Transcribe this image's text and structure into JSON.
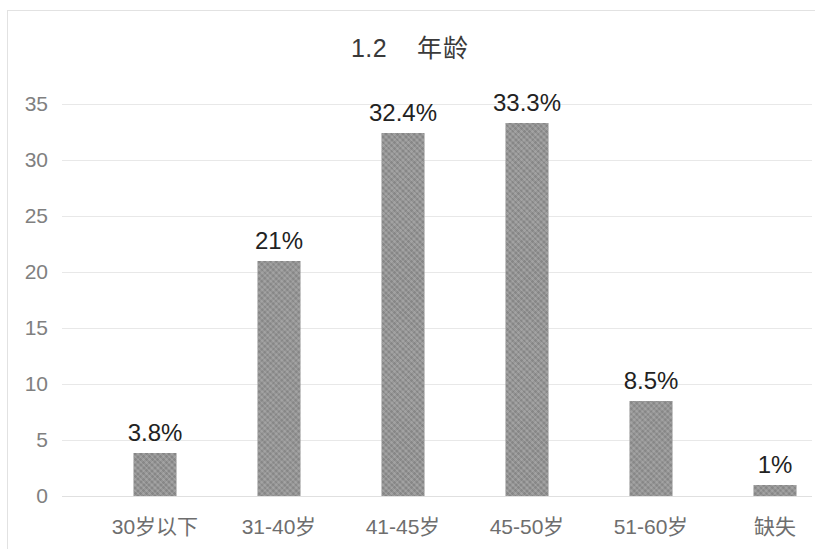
{
  "chart_data": {
    "type": "bar",
    "title": "1.2    年龄",
    "title_number": "1.2",
    "title_text": "年龄",
    "xlabel": "",
    "ylabel": "",
    "categories": [
      "30岁以下",
      "31-40岁",
      "41-45岁",
      "45-50岁",
      "51-60岁",
      "缺失"
    ],
    "values": [
      3.8,
      21,
      32.4,
      33.3,
      8.5,
      1
    ],
    "data_labels": [
      "3.8%",
      "21%",
      "32.4%",
      "33.3%",
      "8.5%",
      "1%"
    ],
    "ylim": [
      0,
      35
    ],
    "yticks": [
      0,
      5,
      10,
      15,
      20,
      25,
      30,
      35
    ],
    "ytick_labels": [
      "0",
      "5",
      "10",
      "15",
      "20",
      "25",
      "30",
      "35"
    ],
    "grid": true,
    "grid_axis": "y",
    "legend": false,
    "series": [
      {
        "name": "年龄",
        "values": [
          3.8,
          21,
          32.4,
          33.3,
          8.5,
          1
        ],
        "color": "#909090"
      }
    ],
    "colors": {
      "bar": "#909090",
      "gridline": "#e8e8e8",
      "tick_label": "#7c7c7c",
      "data_label": "#222222",
      "title": "#3a3a3a",
      "background": "#ffffff",
      "frame": "#e2e2e2"
    }
  }
}
